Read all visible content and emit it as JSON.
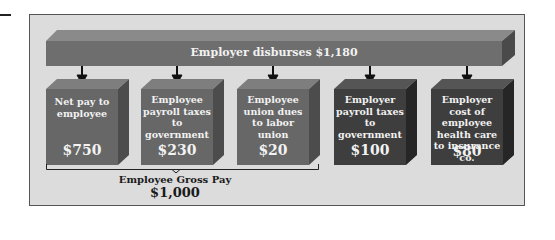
{
  "diagram": {
    "title_bar": {
      "label": "Employer disburses $1,180"
    },
    "boxes": [
      {
        "text": "Net pay to employee",
        "amount": "$750",
        "group": "employee"
      },
      {
        "text": "Employee payroll taxes to government",
        "amount": "$230",
        "group": "employee"
      },
      {
        "text": "Employee union dues to labor union",
        "amount": "$20",
        "group": "employee"
      },
      {
        "text": "Employer payroll taxes to government",
        "amount": "$100",
        "group": "employer"
      },
      {
        "text": "Employer cost of employee health care to insurance co.",
        "amount": "$80",
        "group": "employer"
      }
    ],
    "bracket": {
      "label": "Employee Gross Pay",
      "amount": "$1,000"
    },
    "colors": {
      "frame_bg": "#dcdcdc",
      "bar_front": "#6e6e6e",
      "bar_top": "#888888",
      "bar_side": "#4a4a4a",
      "employee_box_front": "#676767",
      "employer_box_front": "#3e3e3e",
      "arrow": "#111111"
    }
  }
}
